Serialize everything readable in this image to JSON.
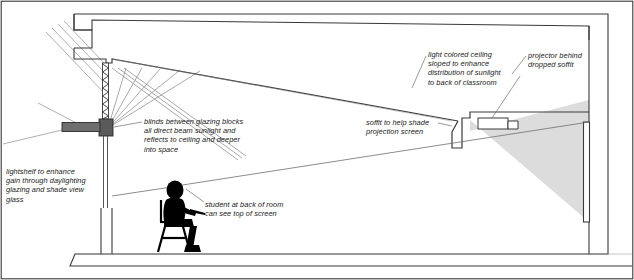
{
  "drawing": {
    "title": "Classroom daylighting and projection section",
    "type": "architectural-section",
    "width": 634,
    "height": 280
  },
  "annotations": {
    "blinds": "blinds between glazing blocks\nall direct beam sunlight and\nreflects to ceiling and deeper\ninto space",
    "lightshelf": "lightshelf to enhance\ngain through daylighting\nglazing and shade view\nglass",
    "student": "student at back of room\ncan see top of screen",
    "soffit": "soffit to help shade\nprojection screen",
    "ceiling": "light colored ceiling\nsloped to enhance\ndistribution of sunlight\nto back of classroom",
    "projector": "projector behind\ndropped soffit"
  },
  "colors": {
    "line": "#3a3a3a",
    "line_light": "#8c8c8c",
    "ray": "#9a9a9a",
    "lightshelf_fill": "#6e6e6e",
    "lightshelf_block_fill": "#5a5a5a",
    "projection_cone_fill": "#dcdcdc",
    "figure_fill": "#000000",
    "text": "#1a1a1a",
    "background": "#ffffff"
  },
  "elements": {
    "frame": "outer-border",
    "left_wall": "exterior-wall-with-parapet",
    "glazing_block": "hatched-glazing-block-with-blinds",
    "lightshelf": "exterior-lightshelf",
    "view_glass": "view-glazing-below-lightshelf",
    "ceiling": "sloped-light-colored-ceiling",
    "soffit": "dropped-soffit",
    "projector": "ceiling-mounted-projector",
    "screen": "projection-screen-on-end-wall",
    "floor": "floor-slab",
    "figure": "seated-student-silhouette",
    "sun_rays": "incoming-direct-beam-sunlight",
    "reflected_rays": "reflected-sunlight-to-ceiling",
    "sight_line": "student-sight-line-to-screen-top",
    "projection_cone": "projector-light-cone"
  }
}
